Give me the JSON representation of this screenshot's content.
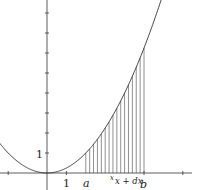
{
  "diagram": {
    "function": "y = x^2 / 4",
    "labels": {
      "y_one": "1",
      "x_one": "1",
      "a": "a",
      "x": "x",
      "x_plus_dx": "x + dx",
      "b": "b"
    },
    "a_value": 2,
    "b_value": 5,
    "strip_count": 15,
    "colors": {
      "stroke": "#333333",
      "background": "#ffffff"
    }
  }
}
